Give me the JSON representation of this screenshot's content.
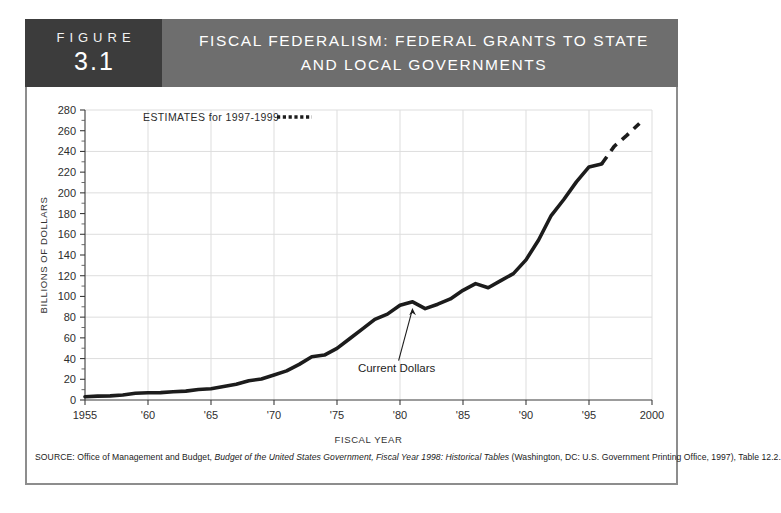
{
  "figure": {
    "label_word": "FIGURE",
    "number": "3.1",
    "title_line1": "FISCAL FEDERALISM: FEDERAL GRANTS TO STATE",
    "title_line2": "AND LOCAL GOVERNMENTS"
  },
  "colors": {
    "header_band": "#6e6e6e",
    "figure_tag": "#3c3c3c",
    "line": "#1c1c1c",
    "grid": "#dddddd",
    "frame": "#8d8d8d"
  },
  "annotations": {
    "legend_label": "ESTIMATES for 1997-1999",
    "series_label": "Current Dollars"
  },
  "source": {
    "prefix": "SOURCE:",
    "text_before_italic": " Office of Management and Budget, ",
    "italic": "Budget of the United States Government, Fiscal Year 1998: Historical Tables",
    "text_after_italic": " (Washington, DC: U.S. Government Printing Office, 1997), Table 12.2."
  },
  "chart_data": {
    "type": "line",
    "title": "FISCAL FEDERALISM: FEDERAL GRANTS TO STATE AND LOCAL GOVERNMENTS",
    "xlabel": "FISCAL YEAR",
    "ylabel": "BILLIONS OF DOLLARS",
    "xlim": [
      1955,
      2000
    ],
    "ylim": [
      0,
      280
    ],
    "y_ticks": [
      0,
      20,
      40,
      60,
      80,
      100,
      120,
      140,
      160,
      180,
      200,
      220,
      240,
      260,
      280
    ],
    "y_tick_labels": [
      "0",
      "20",
      "40",
      "60",
      "80",
      "100",
      "120",
      "140",
      "160",
      "180",
      "200",
      "220",
      "240",
      "260",
      "280"
    ],
    "y_gridlines": [
      40,
      80,
      120,
      160,
      200,
      240,
      280
    ],
    "y_minor_step": 10,
    "x_ticks": [
      1955,
      1960,
      1965,
      1970,
      1975,
      1980,
      1985,
      1990,
      1995,
      2000
    ],
    "x_tick_labels": [
      "1955",
      "'60",
      "'65",
      "'70",
      "'75",
      "'80",
      "'85",
      "'90",
      "'95",
      "2000"
    ],
    "grid": true,
    "legend_position": "top-left",
    "series": [
      {
        "name": "Current Dollars",
        "style": "solid",
        "x": [
          1955,
          1956,
          1957,
          1958,
          1959,
          1960,
          1961,
          1962,
          1963,
          1964,
          1965,
          1966,
          1967,
          1968,
          1969,
          1970,
          1971,
          1972,
          1973,
          1974,
          1975,
          1976,
          1977,
          1978,
          1979,
          1980,
          1981,
          1982,
          1983,
          1984,
          1985,
          1986,
          1987,
          1988,
          1989,
          1990,
          1991,
          1992,
          1993,
          1994,
          1995,
          1996
        ],
        "values": [
          3.2,
          3.7,
          4.0,
          4.9,
          6.5,
          7.0,
          7.1,
          7.9,
          8.6,
          10.1,
          10.9,
          13.0,
          15.2,
          18.6,
          20.3,
          24.1,
          28.1,
          34.4,
          41.8,
          43.4,
          49.8,
          59.1,
          68.4,
          77.9,
          82.9,
          91.4,
          94.8,
          88.2,
          92.5,
          97.6,
          105.9,
          112.4,
          108.4,
          115.3,
          122.0,
          135.3,
          154.5,
          178.1,
          193.6,
          210.6,
          225.0,
          227.8
        ]
      },
      {
        "name": "Estimates 1997-1999",
        "style": "dashed",
        "x": [
          1996,
          1997,
          1998,
          1999
        ],
        "values": [
          227.8,
          244.9,
          255.5,
          267.0
        ]
      }
    ],
    "annotations": [
      {
        "text": "Current Dollars",
        "x": 1981,
        "y": 95,
        "kind": "arrow-callout"
      },
      {
        "text": "ESTIMATES for 1997-1999",
        "kind": "legend",
        "style": "dashed"
      }
    ]
  }
}
